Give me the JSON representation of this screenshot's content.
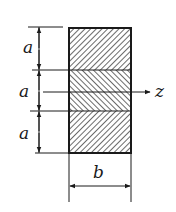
{
  "diagram": {
    "type": "cross-section",
    "labels": {
      "segment_top": "a",
      "segment_middle": "a",
      "segment_bottom": "a",
      "width": "b",
      "axis": "z"
    },
    "layers": [
      {
        "position": "top",
        "height_label": "a",
        "hatch": "backslash"
      },
      {
        "position": "middle",
        "height_label": "a",
        "hatch": "slash"
      },
      {
        "position": "bottom",
        "height_label": "a",
        "hatch": "backslash"
      }
    ],
    "colors": {
      "line": "#1a1a1a",
      "background": "#ffffff"
    }
  }
}
